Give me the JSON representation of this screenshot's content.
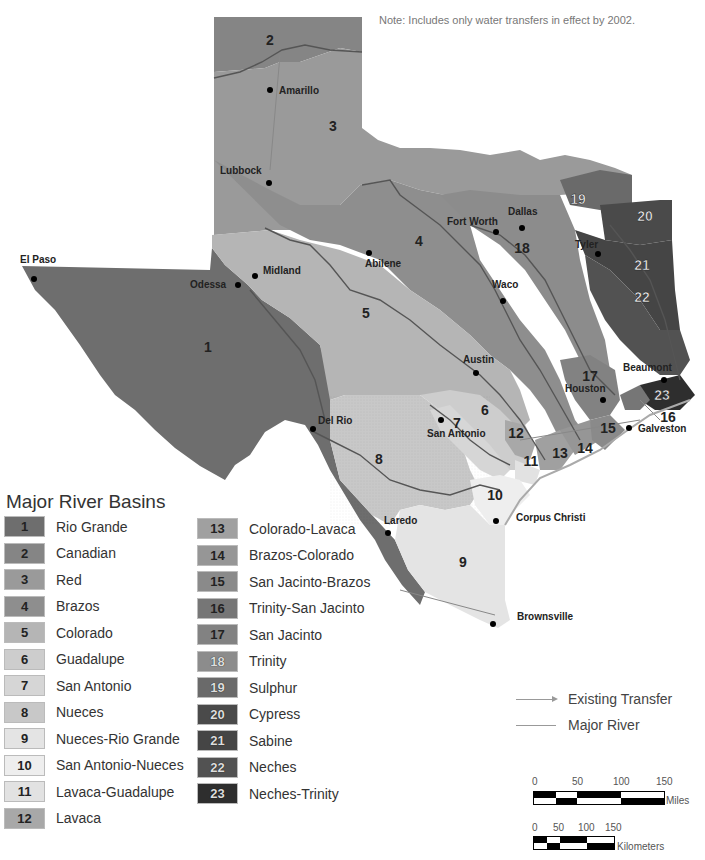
{
  "note": "Note: Includes only water transfers in effect by 2002.",
  "legend": {
    "title": "Major River Basins",
    "basins": [
      {
        "num": "1",
        "name": "Rio Grande",
        "color": "#6e6e6e"
      },
      {
        "num": "2",
        "name": "Canadian",
        "color": "#858585"
      },
      {
        "num": "3",
        "name": "Red",
        "color": "#9a9a9a"
      },
      {
        "num": "4",
        "name": "Brazos",
        "color": "#8e8e8e"
      },
      {
        "num": "5",
        "name": "Colorado",
        "color": "#b5b5b5"
      },
      {
        "num": "6",
        "name": "Guadalupe",
        "color": "#cdcdcd"
      },
      {
        "num": "7",
        "name": "San Antonio",
        "color": "#d6d6d6"
      },
      {
        "num": "8",
        "name": "Nueces",
        "color": "#c8c8c8"
      },
      {
        "num": "9",
        "name": "Nueces-Rio Grande",
        "color": "#e4e4e4"
      },
      {
        "num": "10",
        "name": "San Antonio-Nueces",
        "color": "#eeeeee"
      },
      {
        "num": "11",
        "name": "Lavaca-Guadalupe",
        "color": "#e2e2e2"
      },
      {
        "num": "12",
        "name": "Lavaca",
        "color": "#a8a8a8"
      },
      {
        "num": "13",
        "name": "Colorado-Lavaca",
        "color": "#a0a0a0"
      },
      {
        "num": "14",
        "name": "Brazos-Colorado",
        "color": "#969696"
      },
      {
        "num": "15",
        "name": "San Jacinto-Brazos",
        "color": "#8a8a8a"
      },
      {
        "num": "16",
        "name": "Trinity-San Jacinto",
        "color": "#767676"
      },
      {
        "num": "17",
        "name": "San Jacinto",
        "color": "#828282"
      },
      {
        "num": "18",
        "name": "Trinity",
        "color": "#8c8c8c"
      },
      {
        "num": "19",
        "name": "Sulphur",
        "color": "#6a6a6a"
      },
      {
        "num": "20",
        "name": "Cypress",
        "color": "#4a4a4a"
      },
      {
        "num": "21",
        "name": "Sabine",
        "color": "#454545"
      },
      {
        "num": "22",
        "name": "Neches",
        "color": "#525252"
      },
      {
        "num": "23",
        "name": "Neches-Trinity",
        "color": "#2e2e2e"
      }
    ],
    "lines": [
      {
        "label": "Existing Transfer",
        "type": "arrow"
      },
      {
        "label": "Major River",
        "type": "line"
      }
    ]
  },
  "scale": {
    "miles": {
      "ticks": [
        "0",
        "50",
        "100",
        "150"
      ],
      "unit": "Miles"
    },
    "km": {
      "ticks": [
        "0",
        "50",
        "100",
        "150"
      ],
      "unit": "Kilometers"
    }
  },
  "cities": [
    {
      "name": "Amarillo",
      "x": 270,
      "y": 90,
      "lx": 279,
      "ly": 94
    },
    {
      "name": "Lubbock",
      "x": 269,
      "y": 183,
      "lx": 220,
      "ly": 174
    },
    {
      "name": "El Paso",
      "x": 34,
      "y": 279,
      "lx": 20,
      "ly": 263
    },
    {
      "name": "Midland",
      "x": 255,
      "y": 276,
      "lx": 263,
      "ly": 274
    },
    {
      "name": "Odessa",
      "x": 238,
      "y": 285,
      "lx": 190,
      "ly": 288
    },
    {
      "name": "Abilene",
      "x": 369,
      "y": 253,
      "lx": 365,
      "ly": 267
    },
    {
      "name": "Fort Worth",
      "x": 496,
      "y": 232,
      "lx": 447,
      "ly": 225
    },
    {
      "name": "Dallas",
      "x": 522,
      "y": 228,
      "lx": 508,
      "ly": 215
    },
    {
      "name": "Tyler",
      "x": 598,
      "y": 254,
      "lx": 575,
      "ly": 248
    },
    {
      "name": "Waco",
      "x": 503,
      "y": 301,
      "lx": 492,
      "ly": 288
    },
    {
      "name": "Austin",
      "x": 476,
      "y": 373,
      "lx": 463,
      "ly": 363
    },
    {
      "name": "Houston",
      "x": 603,
      "y": 400,
      "lx": 565,
      "ly": 392
    },
    {
      "name": "Beaumont",
      "x": 664,
      "y": 380,
      "lx": 623,
      "ly": 371
    },
    {
      "name": "Galveston",
      "x": 629,
      "y": 428,
      "lx": 638,
      "ly": 432
    },
    {
      "name": "San Antonio",
      "x": 441,
      "y": 420,
      "lx": 427,
      "ly": 437
    },
    {
      "name": "Del Rio",
      "x": 313,
      "y": 429,
      "lx": 318,
      "ly": 424
    },
    {
      "name": "Laredo",
      "x": 388,
      "y": 533,
      "lx": 384,
      "ly": 524
    },
    {
      "name": "Corpus Christi",
      "x": 496,
      "y": 521,
      "lx": 516,
      "ly": 521
    },
    {
      "name": "Brownsville",
      "x": 493,
      "y": 624,
      "lx": 517,
      "ly": 620
    }
  ],
  "basin_labels": [
    {
      "num": "1",
      "x": 208,
      "y": 352
    },
    {
      "num": "2",
      "x": 270,
      "y": 45
    },
    {
      "num": "3",
      "x": 333,
      "y": 131
    },
    {
      "name": "4",
      "num": "4",
      "x": 419,
      "y": 246
    },
    {
      "num": "5",
      "x": 366,
      "y": 318
    },
    {
      "num": "6",
      "x": 485,
      "y": 415
    },
    {
      "num": "7",
      "x": 457,
      "y": 428
    },
    {
      "num": "8",
      "x": 379,
      "y": 464
    },
    {
      "num": "9",
      "x": 463,
      "y": 567
    },
    {
      "num": "10",
      "x": 495,
      "y": 500
    },
    {
      "num": "11",
      "x": 531,
      "y": 466
    },
    {
      "num": "12",
      "x": 516,
      "y": 438
    },
    {
      "num": "13",
      "x": 560,
      "y": 458
    },
    {
      "num": "14",
      "x": 585,
      "y": 453
    },
    {
      "num": "15",
      "x": 608,
      "y": 433
    },
    {
      "num": "16",
      "x": 668,
      "y": 422
    },
    {
      "num": "17",
      "x": 590,
      "y": 381
    },
    {
      "num": "18",
      "x": 522,
      "y": 253
    },
    {
      "num": "19",
      "x": 578,
      "y": 204
    },
    {
      "num": "20",
      "x": 645,
      "y": 221
    },
    {
      "num": "21",
      "x": 642,
      "y": 270
    },
    {
      "num": "22",
      "x": 642,
      "y": 302
    },
    {
      "num": "23",
      "x": 662,
      "y": 400
    }
  ]
}
